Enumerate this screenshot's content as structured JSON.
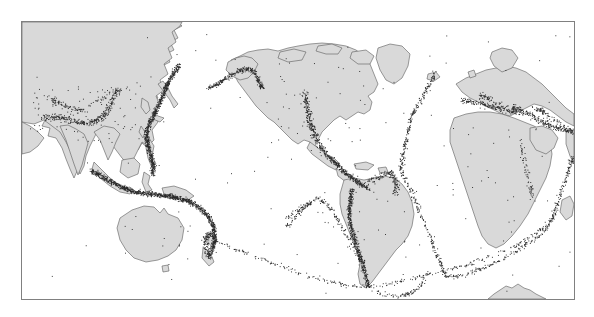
{
  "figure": {
    "kind": "world-earthquake-epicenter-map",
    "title": "",
    "caption": "",
    "projection": "equirectangular (Pacific-centered)",
    "frame": {
      "x": 21,
      "y": 21,
      "width": 552,
      "height": 277,
      "border_color": "#808080"
    },
    "colors": {
      "background": "#ffffff",
      "ocean": "#ffffff",
      "land": "#d9d9d9",
      "coastline": "#5a5a5a",
      "epicenter_dot": "#2a2a2a",
      "frame": "#808080"
    },
    "legend": {
      "visible": false,
      "entries": []
    },
    "axes": {
      "visible": false,
      "ticks": [],
      "labels": []
    },
    "annotations": []
  },
  "chart_data": {
    "type": "scatter",
    "xlabel": "Longitude",
    "ylabel": "Latitude",
    "xlim": [
      20,
      380
    ],
    "ylim": [
      -75,
      80
    ],
    "grid": false,
    "legend_position": "none",
    "point_color": "#2a2a2a",
    "point_size": 0.9,
    "note": "Epicenters trace tectonic plate boundaries; densest along the circum-Pacific Ring of Fire, the Alpine-Himalayan belt, and the mid-ocean ridges.",
    "seismic_belts": [
      {
        "name": "Kamchatka-Kuril-Japan arc",
        "density": "very-high",
        "points": 430
      },
      {
        "name": "Aleutian arc / Alaska",
        "density": "very-high",
        "points": 300
      },
      {
        "name": "Cascadia - San Andreas - Gulf of California",
        "density": "high",
        "points": 280
      },
      {
        "name": "Middle America trench / Central America",
        "density": "very-high",
        "points": 300
      },
      {
        "name": "Caribbean arc",
        "density": "high",
        "points": 150
      },
      {
        "name": "Andes / Peru-Chile trench",
        "density": "very-high",
        "points": 520
      },
      {
        "name": "Scotia arc / South Sandwich",
        "density": "medium",
        "points": 90
      },
      {
        "name": "Philippines - Taiwan - Ryukyu",
        "density": "very-high",
        "points": 340
      },
      {
        "name": "Indonesia - Sunda arc - Banda Sea",
        "density": "very-high",
        "points": 620
      },
      {
        "name": "New Guinea - Solomon - Vanuatu - Tonga-Kermadec",
        "density": "very-high",
        "points": 520
      },
      {
        "name": "New Zealand",
        "density": "high",
        "points": 110
      },
      {
        "name": "Himalaya - Tibet - Central Asia",
        "density": "high",
        "points": 430
      },
      {
        "name": "Iran - Caucasus - Anatolia",
        "density": "high",
        "points": 330
      },
      {
        "name": "Mediterranean - Alpine belt",
        "density": "high",
        "points": 240
      },
      {
        "name": "Mid-Atlantic Ridge (north)",
        "density": "medium",
        "points": 210
      },
      {
        "name": "Mid-Atlantic Ridge (south)",
        "density": "medium",
        "points": 180
      },
      {
        "name": "Southwest Indian Ridge",
        "density": "medium",
        "points": 160
      },
      {
        "name": "Central Indian Ridge / Carlsberg Ridge",
        "density": "medium",
        "points": 150
      },
      {
        "name": "Southeast Indian Ridge / Pacific-Antarctic Ridge",
        "density": "medium",
        "points": 300
      },
      {
        "name": "East Pacific Rise / Chile Rise",
        "density": "medium",
        "points": 230
      },
      {
        "name": "East African Rift",
        "density": "low",
        "points": 70
      },
      {
        "name": "Stable continental interiors (scattered)",
        "density": "very-low",
        "points": 260
      }
    ],
    "total_points_approx": 6500
  },
  "landmasses": [
    {
      "name": "Asia"
    },
    {
      "name": "Australia"
    },
    {
      "name": "New Zealand"
    },
    {
      "name": "North America"
    },
    {
      "name": "Greenland"
    },
    {
      "name": "South America"
    },
    {
      "name": "Africa"
    },
    {
      "name": "Europe"
    },
    {
      "name": "Madagascar"
    },
    {
      "name": "Japan"
    },
    {
      "name": "Philippines"
    },
    {
      "name": "Borneo"
    },
    {
      "name": "New Guinea"
    },
    {
      "name": "Indonesia"
    },
    {
      "name": "Iceland"
    },
    {
      "name": "Antarctic Peninsula"
    },
    {
      "name": "Caribbean islands"
    },
    {
      "name": "British Isles"
    }
  ]
}
